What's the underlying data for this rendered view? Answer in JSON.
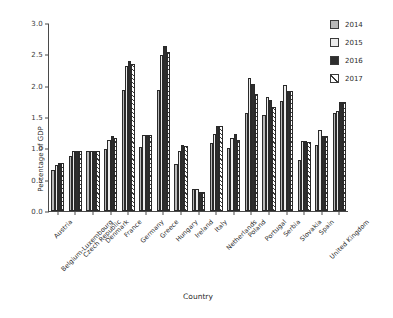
{
  "chart_data": {
    "type": "bar",
    "title": "",
    "xlabel": "Country",
    "ylabel": "Percentage of GDP",
    "ylim": [
      0.0,
      3.0
    ],
    "yticks": [
      "0.0",
      "0.5",
      "1.0",
      "1.5",
      "2.0",
      "2.5",
      "3.0"
    ],
    "ytick_values": [
      0.0,
      0.5,
      1.0,
      1.5,
      2.0,
      2.5,
      3.0
    ],
    "grid": false,
    "legend_position": "top-right",
    "categories": [
      "Austria",
      "Belgium-Luxembourg",
      "Czech Republic",
      "Denmark",
      "France",
      "Germany",
      "Greece",
      "Hungary",
      "Ireland",
      "Italy",
      "Netherlands",
      "Poland",
      "Portugal",
      "Serbia",
      "Slovakia",
      "Spain",
      "United Kingdom"
    ],
    "series": [
      {
        "name": "2014",
        "color": "#b9b9b9",
        "values": [
          0.66,
          0.87,
          0.96,
          0.99,
          1.93,
          1.02,
          1.93,
          0.75,
          0.35,
          1.08,
          1.0,
          1.57,
          1.53,
          1.75,
          0.82,
          1.05,
          1.56
        ]
      },
      {
        "name": "2015",
        "color": "#ececec",
        "values": [
          0.74,
          0.96,
          0.96,
          1.14,
          2.31,
          1.21,
          2.49,
          0.95,
          0.35,
          1.23,
          1.17,
          2.12,
          1.82,
          2.01,
          1.12,
          1.29,
          1.59
        ]
      },
      {
        "name": "2016",
        "color": "#2e2e2e",
        "values": [
          0.76,
          0.95,
          0.96,
          1.19,
          2.39,
          1.22,
          2.63,
          1.05,
          0.3,
          1.36,
          1.23,
          2.03,
          1.77,
          1.92,
          1.12,
          1.19,
          1.74
        ]
      },
      {
        "name": "2017",
        "color": "#ffffff",
        "pattern": "diagonal-hatch",
        "values": [
          0.76,
          0.96,
          0.96,
          1.16,
          2.35,
          1.22,
          2.54,
          1.04,
          0.3,
          1.35,
          1.14,
          1.86,
          1.66,
          1.91,
          1.1,
          1.19,
          1.74
        ]
      }
    ]
  },
  "legend": {
    "items": [
      {
        "label": "2014"
      },
      {
        "label": "2015"
      },
      {
        "label": "2016"
      },
      {
        "label": "2017"
      }
    ]
  }
}
